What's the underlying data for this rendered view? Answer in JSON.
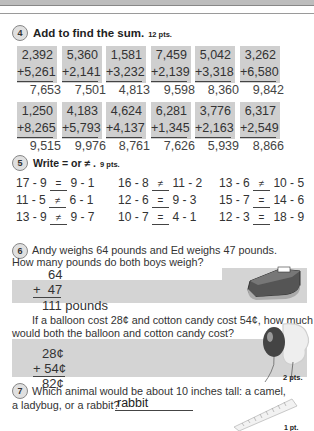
{
  "section4": {
    "number": "4",
    "title": "Add to find the sum.",
    "points": "12 pts.",
    "row1": [
      {
        "top": "2,392",
        "bottom": "+5,261",
        "answer": "7,653"
      },
      {
        "top": "5,360",
        "bottom": "+2,141",
        "answer": "7,501"
      },
      {
        "top": "1,581",
        "bottom": "+3,232",
        "answer": "4,813"
      },
      {
        "top": "7,459",
        "bottom": "+2,139",
        "answer": "9,598"
      },
      {
        "top": "5,042",
        "bottom": "+3,318",
        "answer": "8,360"
      },
      {
        "top": "3,262",
        "bottom": "+6,580",
        "answer": "9,842"
      }
    ],
    "row2": [
      {
        "top": "1,250",
        "bottom": "+8,265",
        "answer": "9,515"
      },
      {
        "top": "4,183",
        "bottom": "+5,793",
        "answer": "9,976"
      },
      {
        "top": "4,624",
        "bottom": "+4,137",
        "answer": "8,761"
      },
      {
        "top": "6,281",
        "bottom": "+1,345",
        "answer": "7,626"
      },
      {
        "top": "3,776",
        "bottom": "+2,163",
        "answer": "5,939"
      },
      {
        "top": "6,317",
        "bottom": "+2,549",
        "answer": "8,866"
      }
    ]
  },
  "section5": {
    "number": "5",
    "title": "Write = or ≠ .",
    "points": "9 pts.",
    "items": [
      {
        "left": "17 - 9",
        "sign": "=",
        "right": "9 - 1"
      },
      {
        "left": "16 - 8",
        "sign": "≠",
        "right": "11 - 2"
      },
      {
        "left": "13 - 6",
        "sign": "≠",
        "right": "10 - 5"
      },
      {
        "left": "11 - 5",
        "sign": "≠",
        "right": "6 - 1"
      },
      {
        "left": "12 - 6",
        "sign": "=",
        "right": "9 - 3"
      },
      {
        "left": "15 - 7",
        "sign": "=",
        "right": "14 - 6"
      },
      {
        "left": "13 - 9",
        "sign": "≠",
        "right": "9 - 7"
      },
      {
        "left": "10 - 7",
        "sign": "=",
        "right": "4 - 1"
      },
      {
        "left": "12 - 3",
        "sign": "=",
        "right": "18 - 9"
      }
    ]
  },
  "section6": {
    "number": "6",
    "q1_line1": "Andy weighs 64 pounds and Ed weighs 47 pounds.",
    "q1_line2": "How many pounds do both boys weigh?",
    "q1_top": "64",
    "q1_bottom": "+  47",
    "q1_answer": "111 pounds",
    "q2_line1": "If a balloon cost 28¢ and cotton candy cost 54¢, how much",
    "q2_line2": "would both the balloon and cotton candy cost?",
    "q2_top": "28¢",
    "q2_bottom": "+ 54¢",
    "q2_answer": "82¢",
    "points": "2 pts."
  },
  "section7": {
    "number": "7",
    "line1": "Which animal would be about 10 inches tall:  a camel,",
    "line2": "a ladybug, or a rabbit?",
    "answer": "rabbit",
    "points": "1 pt."
  }
}
